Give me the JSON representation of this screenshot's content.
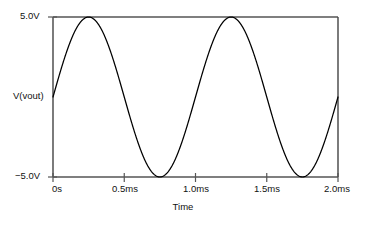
{
  "chart_data": {
    "type": "line",
    "title": "",
    "subtitle": "",
    "xlabel": "Time",
    "ylabel": "V(vout)",
    "xlim": [
      0,
      2.0
    ],
    "ylim": [
      -5.0,
      5.0
    ],
    "x_unit": "ms",
    "y_unit": "V",
    "grid": false,
    "legend": "none",
    "x_ticks": [
      {
        "value": 0,
        "label": "0s"
      },
      {
        "value": 0.5,
        "label": "0.5ms"
      },
      {
        "value": 1.0,
        "label": "1.0ms"
      },
      {
        "value": 1.5,
        "label": "1.5ms"
      },
      {
        "value": 2.0,
        "label": "2.0ms"
      }
    ],
    "y_ticks": [
      {
        "value": 5.0,
        "label": "5.0V"
      },
      {
        "value": -5.0,
        "label": "−5.0V"
      }
    ],
    "series": [
      {
        "name": "V(vout)",
        "color": "#000000",
        "waveform": "sine",
        "amplitude": 5.0,
        "offset": 0.0,
        "frequency_khz": 1.0,
        "cycles": 2,
        "phase_deg": 0,
        "x": [
          0,
          0.05,
          0.1,
          0.15,
          0.2,
          0.25,
          0.3,
          0.35,
          0.4,
          0.45,
          0.5,
          0.55,
          0.6,
          0.65,
          0.7,
          0.75,
          0.8,
          0.85,
          0.9,
          0.95,
          1.0,
          1.05,
          1.1,
          1.15,
          1.2,
          1.25,
          1.3,
          1.35,
          1.4,
          1.45,
          1.5,
          1.55,
          1.6,
          1.65,
          1.7,
          1.75,
          1.8,
          1.85,
          1.9,
          1.95,
          2.0
        ],
        "y": [
          0.0,
          1.55,
          2.94,
          4.05,
          4.76,
          5.0,
          4.76,
          4.05,
          2.94,
          1.55,
          0.0,
          -1.55,
          -2.94,
          -4.05,
          -4.76,
          -5.0,
          -4.76,
          -4.05,
          -2.94,
          -1.55,
          0.0,
          1.55,
          2.94,
          4.05,
          4.76,
          5.0,
          4.76,
          4.05,
          2.94,
          1.55,
          0.0,
          -1.55,
          -2.94,
          -4.05,
          -4.76,
          -5.0,
          -4.76,
          -4.05,
          -2.94,
          -1.55,
          0.0
        ]
      }
    ],
    "annotations": []
  },
  "axes": {
    "y_top_label": "5.0V",
    "y_bottom_label": "−5.0V",
    "y_title": "V(vout)",
    "x_title": "Time",
    "x_tick_labels": [
      "0s",
      "0.5ms",
      "1.0ms",
      "1.5ms",
      "2.0ms"
    ]
  },
  "colors": {
    "trace": "#000000",
    "axis": "#444444",
    "text": "#111111",
    "background": "#ffffff"
  }
}
